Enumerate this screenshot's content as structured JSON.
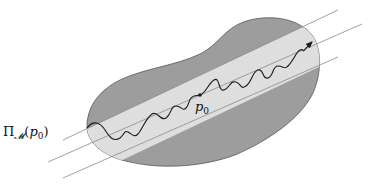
{
  "diagram": {
    "title": "",
    "labels": {
      "point": "p",
      "point_subscript": "0",
      "projection_prefix": "Π",
      "projection_subscript": "𝓜",
      "projection_arg_open": "(",
      "projection_arg_var": "p",
      "projection_arg_sub": "0",
      "projection_arg_close": ")"
    },
    "colors": {
      "background": "#ffffff",
      "region_fill": "#9d9d9d",
      "region_stroke": "#555555",
      "band_fill": "#dedede",
      "guide_lines": "#8a8a8a",
      "trajectory": "#1a1a1a"
    },
    "elements": [
      {
        "name": "manifold-region",
        "description": "dark gray blob"
      },
      {
        "name": "tangent-band",
        "description": "light gray strip between two outer parallel lines"
      },
      {
        "name": "guide-line-top"
      },
      {
        "name": "guide-line-middle"
      },
      {
        "name": "guide-line-bottom"
      },
      {
        "name": "wavy-trajectory",
        "description": "curve ending in arrowhead"
      },
      {
        "name": "point-p0"
      }
    ]
  }
}
